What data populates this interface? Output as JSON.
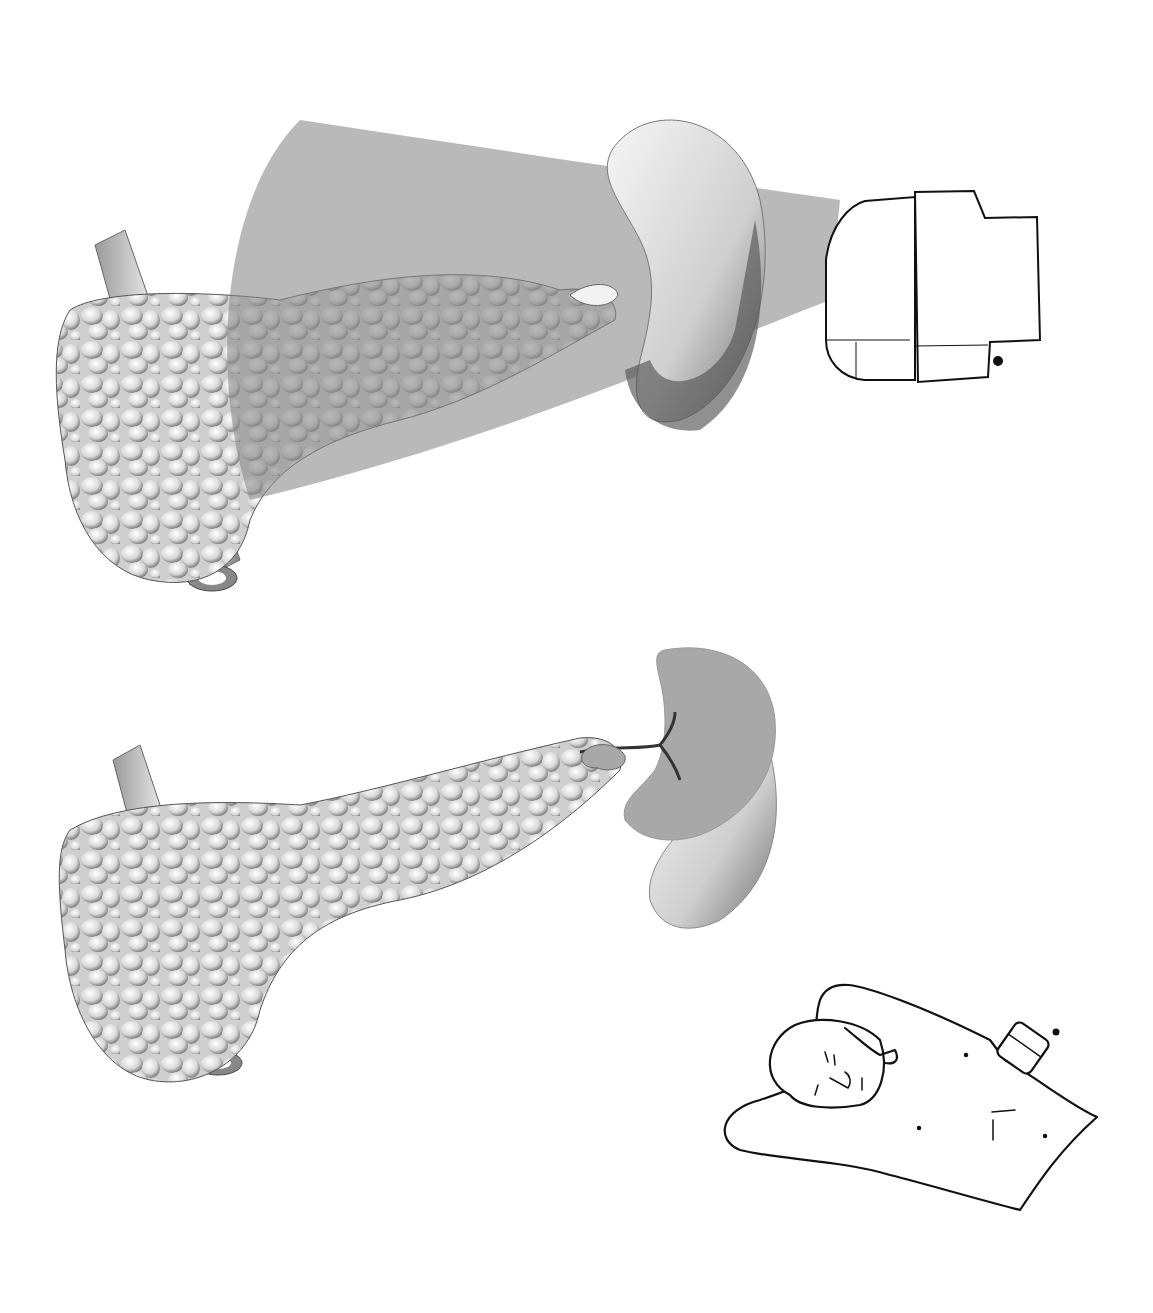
{
  "figure": {
    "type": "medical-illustration",
    "panels": [
      {
        "id": "top",
        "subject": "ultrasound beam through spleen imaging pancreatic tail",
        "elements": [
          "pancreas",
          "vessel-tube",
          "spleen",
          "ultrasound-beam",
          "ultrasound-probe",
          "probe-orientation-marker"
        ]
      },
      {
        "id": "bottom",
        "subject": "cross-section of spleen and pancreatic tail with splenic vessels",
        "elements": [
          "pancreas",
          "vessel-tube",
          "spleen-section",
          "splenic-vessels"
        ]
      },
      {
        "id": "inset",
        "subject": "patient lying supine with arm raised, probe on left flank",
        "elements": [
          "patient-figure",
          "probe",
          "probe-orientation-marker"
        ]
      }
    ]
  },
  "colors": {
    "beam": "#8a8a8a",
    "spleen_cut": "#a8a8a8",
    "organ_light": "#efefef",
    "organ_shadow": "#5a5a5a",
    "outline": "#111111"
  }
}
